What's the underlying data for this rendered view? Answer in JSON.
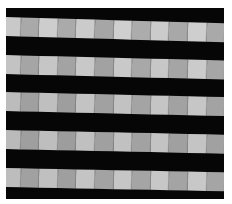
{
  "image": {
    "description": "Grayscale photograph of a woven material with horizontal light stripes made of alternating light and mid-gray rectangular segments, separated by black bands",
    "background_color": "#ffffff",
    "band_color": "#060606",
    "stripes": [
      {
        "top": 9,
        "tilt_deg": 1.6,
        "blocks": [
          "#c9c9c9",
          "#a9a9a9",
          "#cdcdcd",
          "#aaaaaa",
          "#cbcbcb",
          "#a6a6a6",
          "#cfcfcf",
          "#acacac",
          "#cbcbcb",
          "#a8a8a8",
          "#cecece",
          "#a9a9a9"
        ]
      },
      {
        "top": 47,
        "tilt_deg": 1.4,
        "blocks": [
          "#c3c3c3",
          "#a5a5a5",
          "#c6c6c6",
          "#a3a3a3",
          "#c8c8c8",
          "#a2a2a2",
          "#c9c9c9",
          "#a8a8a8",
          "#c7c7c7",
          "#a5a5a5",
          "#cbcbcb",
          "#a6a6a6"
        ]
      },
      {
        "top": 84,
        "tilt_deg": 1.3,
        "blocks": [
          "#bcbcbc",
          "#a0a0a0",
          "#bfbfbf",
          "#9e9e9e",
          "#c3c3c3",
          "#a1a1a1",
          "#c2c2c2",
          "#a4a4a4",
          "#c5c5c5",
          "#a2a2a2",
          "#c6c6c6",
          "#a3a3a3"
        ]
      },
      {
        "top": 122,
        "tilt_deg": 1.2,
        "blocks": [
          "#bababa",
          "#9f9f9f",
          "#bebebe",
          "#9d9d9d",
          "#c0c0c0",
          "#a0a0a0",
          "#c1c1c1",
          "#a2a2a2",
          "#c3c3c3",
          "#a0a0a0",
          "#c4c4c4",
          "#a1a1a1"
        ]
      },
      {
        "top": 160,
        "tilt_deg": 1.1,
        "blocks": [
          "#bdbdbd",
          "#a1a1a1",
          "#c0c0c0",
          "#9f9f9f",
          "#c4c4c4",
          "#a3a3a3",
          "#c6c6c6",
          "#a5a5a5",
          "#c7c7c7",
          "#a4a4a4",
          "#c8c8c8",
          "#a5a5a5"
        ]
      }
    ],
    "block_width": 18.6
  }
}
